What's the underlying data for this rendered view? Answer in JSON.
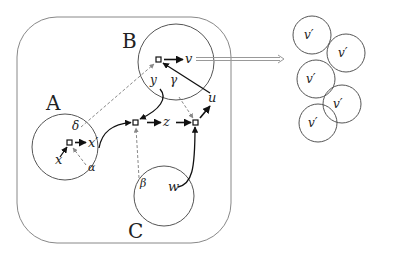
{
  "regions": {
    "A": "A",
    "B": "B",
    "C": "C"
  },
  "nodes": {
    "x_prime_A": "x′",
    "x_in": "x",
    "alpha": "α",
    "delta": "δ",
    "v": "v",
    "y": "y",
    "gamma": "γ",
    "u": "u",
    "z": "z",
    "beta": "β",
    "w": "w"
  },
  "copies": {
    "label": "v′",
    "items": [
      "v′",
      "v′",
      "v′",
      "v′",
      "v′"
    ]
  },
  "colors": {
    "solid_edge": "#111111",
    "dashed_edge": "#888888",
    "outline": "#777777",
    "double_arrow": "#9a9a9a"
  }
}
